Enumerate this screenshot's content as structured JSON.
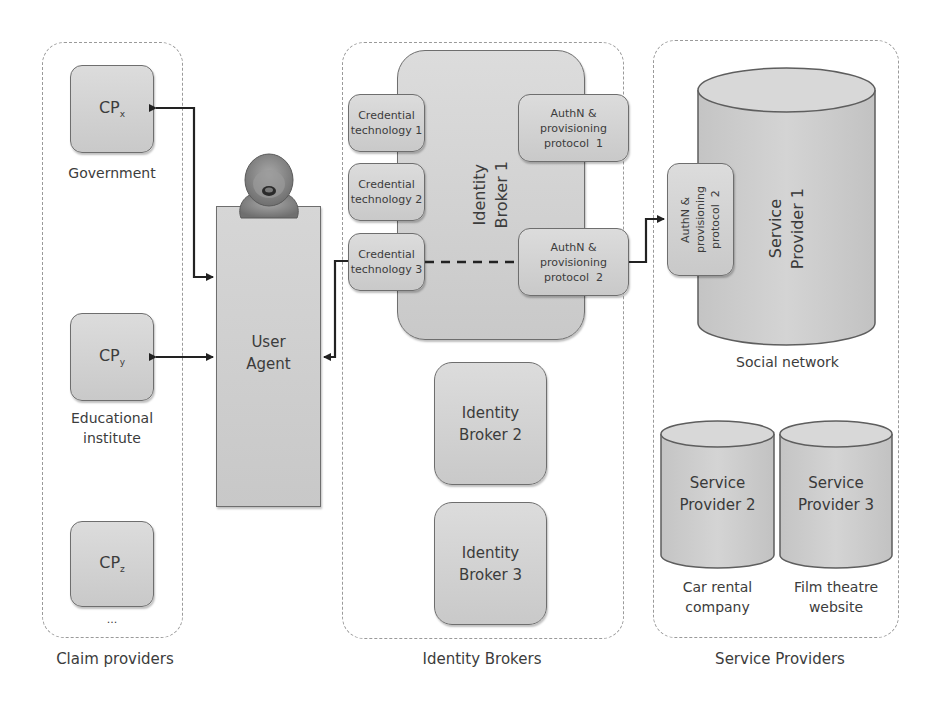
{
  "groups": {
    "claim_providers": {
      "label": "Claim providers",
      "items": [
        {
          "name": "CP",
          "sub": "x",
          "caption": "Government"
        },
        {
          "name": "CP",
          "sub": "y",
          "caption_line1": "Educational",
          "caption_line2": "institute"
        },
        {
          "name": "CP",
          "sub": "z",
          "caption": "..."
        }
      ]
    },
    "identity_brokers": {
      "label": "Identity Brokers",
      "broker1": {
        "title_line1": "Identity",
        "title_line2": "Broker 1",
        "credentials": [
          {
            "line1": "Credential",
            "line2": "technology 1"
          },
          {
            "line1": "Credential",
            "line2": "technology 2"
          },
          {
            "line1": "Credential",
            "line2": "technology 3"
          }
        ],
        "protocols": [
          {
            "line1": "AuthN &",
            "line2": "provisioning",
            "line3": "protocol  1"
          },
          {
            "line1": "AuthN &",
            "line2": "provisioning",
            "line3": "protocol  2"
          }
        ]
      },
      "broker2": {
        "line1": "Identity",
        "line2": "Broker 2"
      },
      "broker3": {
        "line1": "Identity",
        "line2": "Broker 3"
      }
    },
    "service_providers": {
      "label": "Service Providers",
      "sp1": {
        "line1": "Service",
        "line2": "Provider 1",
        "caption": "Social network",
        "protocol": {
          "line1": "AuthN &",
          "line2": "provisioning",
          "line3": "protocol  2"
        }
      },
      "sp2": {
        "line1": "Service",
        "line2": "Provider 2",
        "caption_line1": "Car rental",
        "caption_line2": "company"
      },
      "sp3": {
        "line1": "Service",
        "line2": "Provider 3",
        "caption_line1": "Film theatre",
        "caption_line2": "website"
      }
    }
  },
  "user_agent": {
    "line1": "User",
    "line2": "Agent",
    "icon": "user-avatar-icon"
  },
  "colors": {
    "box_fill": "#d3d3d3",
    "box_border": "#6e6e6e",
    "dashed_border": "#9a9a9a",
    "connector": "#222222"
  }
}
